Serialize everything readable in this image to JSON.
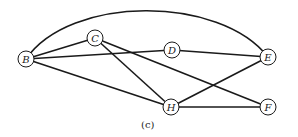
{
  "caption": "(c)",
  "nodes": [
    {
      "id": "B",
      "label": "B",
      "x": 26,
      "y": 59
    },
    {
      "id": "C",
      "label": "C",
      "x": 95,
      "y": 38
    },
    {
      "id": "D",
      "label": "D",
      "x": 172,
      "y": 50
    },
    {
      "id": "E",
      "label": "E",
      "x": 268,
      "y": 57
    },
    {
      "id": "H",
      "label": "H",
      "x": 171,
      "y": 107
    },
    {
      "id": "F",
      "label": "F",
      "x": 268,
      "y": 107
    }
  ],
  "edges": [
    {
      "from": "B",
      "to": "E",
      "curved": true
    },
    {
      "from": "B",
      "to": "C"
    },
    {
      "from": "B",
      "to": "D"
    },
    {
      "from": "B",
      "to": "H"
    },
    {
      "from": "C",
      "to": "H"
    },
    {
      "from": "C",
      "to": "F"
    },
    {
      "from": "D",
      "to": "E"
    },
    {
      "from": "H",
      "to": "E"
    },
    {
      "from": "H",
      "to": "F"
    }
  ]
}
